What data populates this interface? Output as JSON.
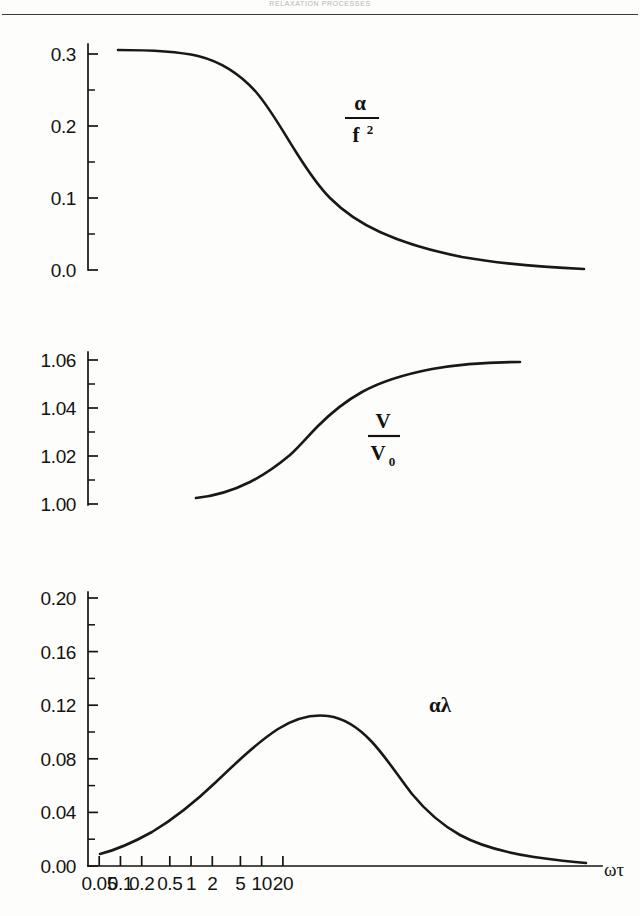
{
  "header": {
    "running_head": "RELAXATION  PROCESSES"
  },
  "figure": {
    "x_axis_title": "ωτ",
    "x_tick_labels": [
      "0.05",
      "0.1",
      "0.2",
      "0.5",
      "1",
      "2",
      "5",
      "10",
      "20"
    ],
    "panel1_label_numerator": "α",
    "panel1_label_denominator": "f",
    "panel1_label_denominator_exp": "2",
    "panel2_label_numerator": "V",
    "panel2_label_denominator": "V",
    "panel2_label_denominator_sub": "0",
    "panel3_label": "αλ",
    "panel1_yticks": [
      "0.3",
      "0.2",
      "0.1",
      "0.0"
    ],
    "panel2_yticks": [
      "1.06",
      "1.04",
      "1.02",
      "1.00"
    ],
    "panel3_yticks": [
      "0.20",
      "0.16",
      "0.12",
      "0.08",
      "0.04",
      "0.00"
    ]
  },
  "chart_data": [
    {
      "type": "line",
      "title": "",
      "xlabel": "ωτ",
      "ylabel": "α/f²",
      "xscale": "log",
      "xlim": [
        0.03,
        30
      ],
      "ylim": [
        0.0,
        0.32
      ],
      "grid": false,
      "legend": "none",
      "annotation": "α/f²",
      "x": [
        0.04,
        0.05,
        0.07,
        0.1,
        0.15,
        0.2,
        0.3,
        0.4,
        0.5,
        0.7,
        1.0,
        1.4,
        2.0,
        3.0,
        4.0,
        5.0,
        7.0,
        10.0,
        14.0,
        20.0,
        30.0
      ],
      "y": [
        0.317,
        0.317,
        0.316,
        0.313,
        0.306,
        0.297,
        0.273,
        0.248,
        0.225,
        0.183,
        0.138,
        0.1,
        0.069,
        0.04,
        0.027,
        0.019,
        0.011,
        0.0065,
        0.0042,
        0.0025,
        0.0015
      ]
    },
    {
      "type": "line",
      "title": "",
      "xlabel": "ωτ",
      "ylabel": "V/V0",
      "xscale": "log",
      "xlim": [
        0.03,
        30
      ],
      "ylim": [
        0.995,
        1.068
      ],
      "grid": false,
      "legend": "none",
      "annotation": "V/V₀",
      "x": [
        0.15,
        0.2,
        0.3,
        0.4,
        0.5,
        0.7,
        1.0,
        1.4,
        2.0,
        3.0,
        4.0,
        5.0,
        7.0,
        10.0,
        14.0,
        20.0,
        30.0
      ],
      "y": [
        0.9995,
        1.0012,
        1.0048,
        1.0082,
        1.0112,
        1.017,
        1.0268,
        1.0352,
        1.042,
        1.048,
        1.0505,
        1.0518,
        1.0532,
        1.054,
        1.0543,
        1.0545,
        1.0545
      ]
    },
    {
      "type": "line",
      "title": "",
      "xlabel": "ωτ",
      "ylabel": "αλ",
      "xscale": "log",
      "xlim": [
        0.03,
        30
      ],
      "ylim": [
        0.0,
        0.2
      ],
      "grid": false,
      "legend": "none",
      "annotation": "αλ",
      "x": [
        0.035,
        0.05,
        0.07,
        0.1,
        0.15,
        0.2,
        0.3,
        0.4,
        0.5,
        0.7,
        1.0,
        1.4,
        2.0,
        3.0,
        4.0,
        5.0,
        7.0,
        10.0,
        14.0,
        20.0,
        30.0
      ],
      "y": [
        0.0085,
        0.0165,
        0.0245,
        0.0335,
        0.049,
        0.064,
        0.091,
        0.112,
        0.13,
        0.154,
        0.167,
        0.16,
        0.14,
        0.107,
        0.086,
        0.07,
        0.051,
        0.036,
        0.0255,
        0.0175,
        0.009
      ]
    }
  ]
}
